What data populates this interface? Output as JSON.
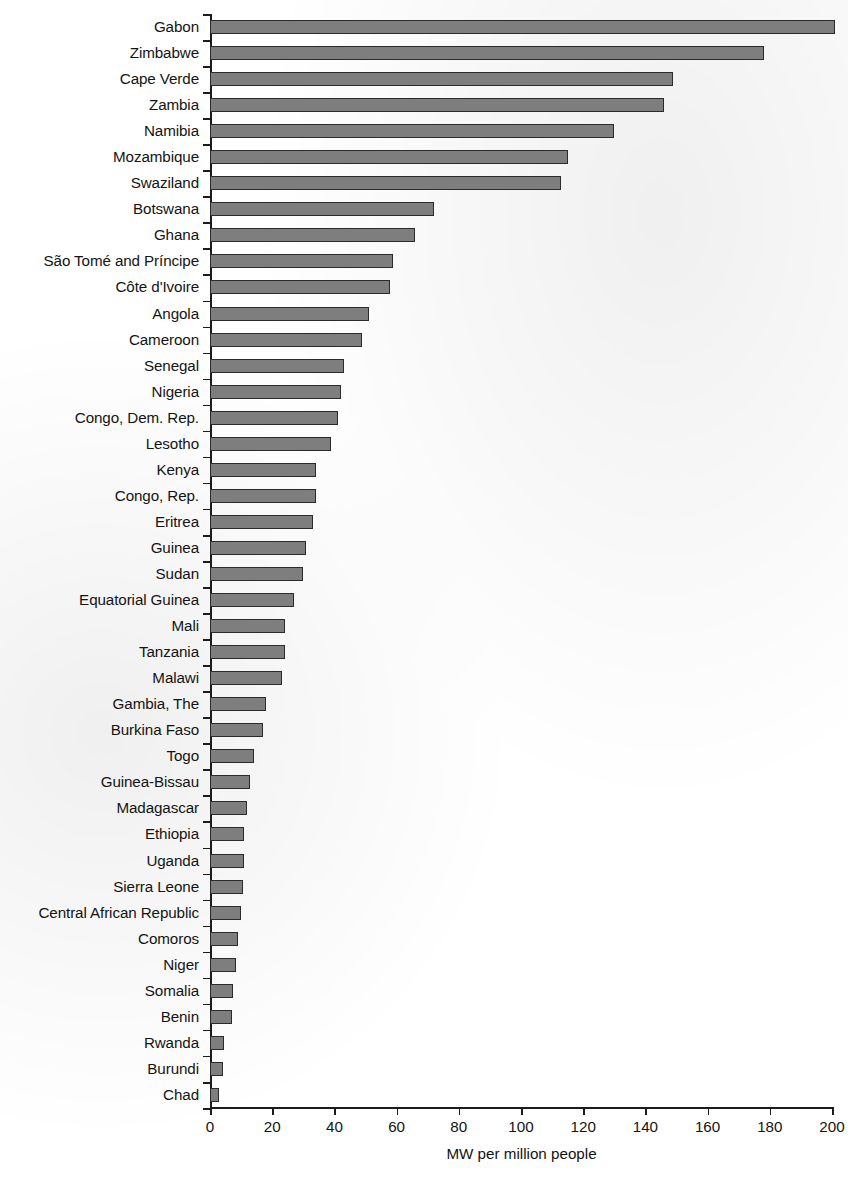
{
  "chart_data": {
    "type": "bar",
    "orientation": "horizontal",
    "title": "",
    "xlabel": "MW per million people",
    "ylabel": "",
    "xlim": [
      0,
      200
    ],
    "xticks": [
      0,
      20,
      40,
      60,
      80,
      100,
      120,
      140,
      160,
      180,
      200
    ],
    "xtick_labels": [
      "0",
      "20",
      "40",
      "60",
      "80",
      "100",
      "120",
      "140",
      "160",
      "180",
      "200"
    ],
    "grid": false,
    "legend": null,
    "bar_color": "#7e7e7e",
    "bar_edge_color": "#2b2b2b",
    "categories": [
      "Gabon",
      "Zimbabwe",
      "Cape Verde",
      "Zambia",
      "Namibia",
      "Mozambique",
      "Swaziland",
      "Botswana",
      "Ghana",
      "São Tomé and Príncipe",
      "Côte d'Ivoire",
      "Angola",
      "Cameroon",
      "Senegal",
      "Nigeria",
      "Congo, Dem. Rep.",
      "Lesotho",
      "Kenya",
      "Congo, Rep.",
      "Eritrea",
      "Guinea",
      "Sudan",
      "Equatorial Guinea",
      "Mali",
      "Tanzania",
      "Malawi",
      "Gambia, The",
      "Burkina Faso",
      "Togo",
      "Guinea-Bissau",
      "Madagascar",
      "Ethiopia",
      "Uganda",
      "Sierra Leone",
      "Central African Republic",
      "Comoros",
      "Niger",
      "Somalia",
      "Benin",
      "Rwanda",
      "Burundi",
      "Chad"
    ],
    "values": [
      201,
      178,
      149,
      146,
      130,
      115,
      113,
      72,
      66,
      59,
      58,
      51,
      49,
      43,
      42,
      41,
      39,
      34,
      34,
      33,
      31,
      30,
      27,
      24,
      24,
      23,
      18,
      17,
      14,
      13,
      12,
      11,
      11,
      10.5,
      10,
      9,
      8.5,
      7.5,
      7,
      4.5,
      4.2,
      2.8
    ]
  }
}
